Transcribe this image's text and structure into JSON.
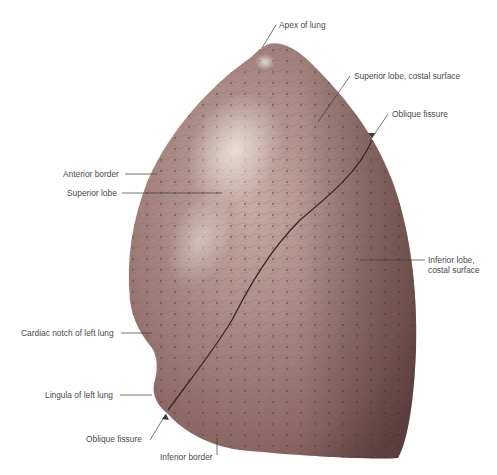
{
  "figure": {
    "colors": {
      "lung_base": "#9a7672",
      "lung_dark": "#6e4c4a",
      "lung_light": "#c7aba1",
      "highlight": "#efe6e0",
      "leader_line": "#3a3a3a",
      "label_text": "#4a4a4a",
      "background": "#ffffff"
    }
  },
  "labels": {
    "apex": "Apex of lung",
    "superior_lobe_costal": "Superior lobe, costal surface",
    "oblique_fissure_top": "Oblique fissure",
    "anterior_border": "Anterior border",
    "superior_lobe": "Superior lobe",
    "inferior_lobe_line1": "Inferior lobe,",
    "inferior_lobe_line2": "costal surface",
    "cardiac_notch": "Cardiac notch of left lung",
    "lingula": "Lingula of left lung",
    "oblique_fissure_bottom": "Oblique fissure",
    "inferior_border": "Inferior border"
  }
}
